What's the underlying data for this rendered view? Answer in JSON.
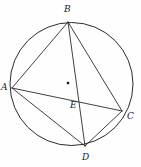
{
  "figure": {
    "background_color": "#fefefe",
    "stroke_color": "#2b2b2b",
    "label_color": "#1a1a1a"
  },
  "chart_data": {
    "type": "diagram",
    "circle": {
      "name": "circumscribed-circle",
      "center_x": 71.5,
      "center_y": 84,
      "radius": 61.5
    },
    "center_marker": {
      "name": "center-dot",
      "x": 68,
      "y": 83,
      "size": 2.4
    },
    "points": [
      {
        "id": "A",
        "label": "A",
        "x": 12,
        "y": 88,
        "label_x": 1,
        "label_y": 83
      },
      {
        "id": "B",
        "label": "B",
        "x": 68,
        "y": 22,
        "label_x": 64,
        "label_y": 5
      },
      {
        "id": "C",
        "label": "C",
        "x": 122,
        "y": 111,
        "label_x": 127,
        "label_y": 112
      },
      {
        "id": "D",
        "label": "D",
        "x": 85,
        "y": 146,
        "label_x": 82,
        "label_y": 153
      },
      {
        "id": "E",
        "label": "E",
        "x": 79,
        "y": 101,
        "label_x": 70,
        "label_y": 101
      }
    ],
    "segments": [
      {
        "name": "chord-AB",
        "from": "A",
        "to": "B",
        "x1": 12,
        "y1": 88,
        "x2": 68,
        "y2": 22
      },
      {
        "name": "chord-AC",
        "from": "A",
        "to": "C",
        "x1": 12,
        "y1": 88,
        "x2": 122,
        "y2": 111
      },
      {
        "name": "chord-AD",
        "from": "A",
        "to": "D",
        "x1": 12,
        "y1": 88,
        "x2": 85,
        "y2": 146
      },
      {
        "name": "chord-BC",
        "from": "B",
        "to": "C",
        "x1": 68,
        "y1": 22,
        "x2": 122,
        "y2": 111
      },
      {
        "name": "chord-BD",
        "from": "B",
        "to": "D",
        "x1": 68,
        "y1": 22,
        "x2": 85,
        "y2": 146
      },
      {
        "name": "chord-CD",
        "from": "C",
        "to": "D",
        "x1": 122,
        "y1": 111,
        "x2": 85,
        "y2": 146
      }
    ]
  }
}
